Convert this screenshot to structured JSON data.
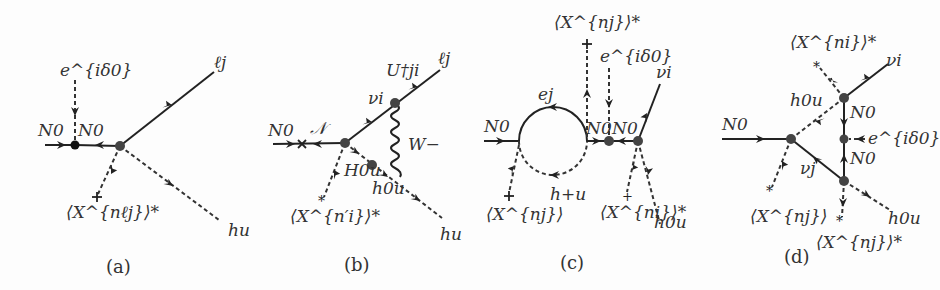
{
  "figure": {
    "background": "#fdfdfd",
    "line_color": "#222222"
  },
  "diagrams": [
    {
      "id": "a",
      "caption": "(a)",
      "labels": {
        "phase": "e^{iδ0}",
        "N0_in": "N0",
        "N0_mid": "N0",
        "lepton": "ℓj",
        "higgs": "hu",
        "vev": "⟨X^{nℓj}⟩*"
      }
    },
    {
      "id": "b",
      "caption": "(b)",
      "labels": {
        "N0_in": "N0",
        "N_mid": "𝒩",
        "nu": "νi",
        "U": "U†ji",
        "lepton": "ℓj",
        "W": "W−",
        "H": "H0u",
        "h": "h0u",
        "higgs": "hu",
        "vev": "⟨X^{n′i}⟩*"
      }
    },
    {
      "id": "c",
      "caption": "(c)",
      "labels": {
        "N0_in": "N0",
        "e": "ej",
        "vev_top": "⟨X^{nj}⟩*",
        "phase": "e^{iδ0}",
        "N0_a": "N0",
        "N0_b": "N0",
        "nu": "νi",
        "h_plus": "h+u",
        "vev_left": "⟨X^{nj}⟩",
        "vev_right": "⟨X^{ni}⟩*",
        "h0": "h0u"
      }
    },
    {
      "id": "d",
      "caption": "(d)",
      "labels": {
        "N0_in": "N0",
        "vev_top": "⟨X^{ni}⟩*",
        "nu_i": "νi",
        "h0_top": "h0u",
        "N0_a": "N0",
        "phase": "e^{iδ0}",
        "N0_b": "N0",
        "nu_j": "νj",
        "vev_left": "⟨X^{nj}⟩",
        "vev_bottom": "⟨X^{nj}⟩*",
        "h0_bottom": "h0u"
      }
    }
  ]
}
